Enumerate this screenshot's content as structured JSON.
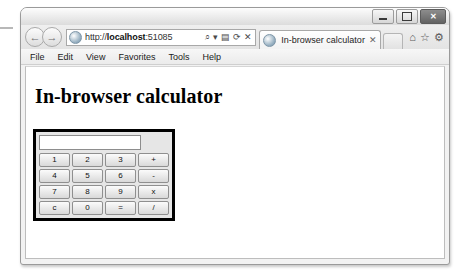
{
  "window": {
    "controls": [
      {
        "name": "minimize",
        "label": "–"
      },
      {
        "name": "maximize",
        "label": "□"
      },
      {
        "name": "close",
        "label": "✕"
      }
    ]
  },
  "nav": {
    "back_label": "←",
    "forward_label": "→",
    "url": "http://localhost:51085",
    "url_host": "localhost",
    "url_scheme": "http://",
    "url_port": ":51085",
    "address_icons": [
      {
        "name": "search-icon",
        "glyph": "⌕"
      },
      {
        "name": "dropdown-icon",
        "glyph": "▾"
      },
      {
        "name": "compatibility-view-icon",
        "glyph": "▤"
      },
      {
        "name": "refresh-icon",
        "glyph": "⟳"
      },
      {
        "name": "stop-icon",
        "glyph": "✕"
      }
    ],
    "tab": {
      "title": "In-browser calculator",
      "close_label": "✕"
    },
    "toolbar_icons": [
      {
        "name": "home-icon",
        "glyph": "⌂"
      },
      {
        "name": "favorites-icon",
        "glyph": "☆"
      },
      {
        "name": "tools-icon",
        "glyph": "⚙"
      }
    ]
  },
  "menubar": {
    "items": [
      "File",
      "Edit",
      "View",
      "Favorites",
      "Tools",
      "Help"
    ]
  },
  "page": {
    "heading": "In-browser calculator",
    "calculator": {
      "display_value": "",
      "display_placeholder": "",
      "keys": [
        "1",
        "2",
        "3",
        "+",
        "4",
        "5",
        "6",
        "-",
        "7",
        "8",
        "9",
        "x",
        "c",
        "0",
        "=",
        "/"
      ]
    }
  },
  "colors": {
    "calculator_border": "#000000",
    "page_background": "#ffffff",
    "chrome_background": "#eeeeee"
  }
}
